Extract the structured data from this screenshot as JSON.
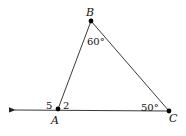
{
  "diagram": {
    "type": "triangle-exterior-angle",
    "points": {
      "A": {
        "label": "A",
        "x": 58,
        "y": 109
      },
      "B": {
        "label": "B",
        "x": 91,
        "y": 21
      },
      "C": {
        "label": "C",
        "x": 169,
        "y": 111
      }
    },
    "ray": {
      "from": "C",
      "through": "A",
      "arrow_end": {
        "x": 13,
        "y": 110
      }
    },
    "angles": {
      "B": "60°",
      "C": "50°",
      "angle_2": "2",
      "angle_5": "5"
    },
    "colors": {
      "stroke": "#222222",
      "point": "#000000",
      "text": "#111111"
    }
  }
}
